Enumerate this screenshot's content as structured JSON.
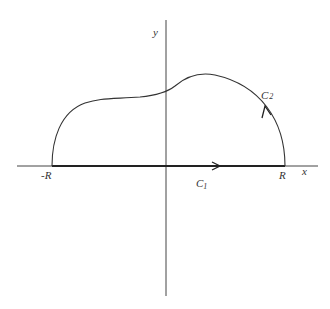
{
  "diagram": {
    "axes": {
      "x_label": "x",
      "y_label": "y"
    },
    "points": {
      "left": "-R",
      "right": "R"
    },
    "contours": {
      "c1": {
        "label": "C",
        "subscript": "1",
        "description": "segment along x-axis from -R to R, arrow pointing right"
      },
      "c2": {
        "label": "C",
        "subscript": "2",
        "description": "curved path from R back to -R above x-axis, arrow counterclockwise"
      }
    },
    "colors": {
      "stroke": "#333333",
      "background": "#ffffff"
    }
  }
}
